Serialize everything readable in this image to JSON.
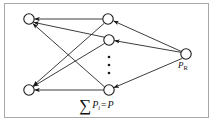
{
  "figure": {
    "type": "network-diagram",
    "width": 215,
    "height": 124,
    "background_color": "#ffffff",
    "border_color": "#a8a8a8",
    "stroke_color": "#1a1a1a"
  },
  "labels": {
    "source_node": {
      "base": "P",
      "subscript": "R",
      "full": "P_R"
    },
    "caption": {
      "sigma": "∑",
      "variable": "P",
      "subscript": "i",
      "equals": "=",
      "result": "P",
      "full": "∑ P_i = P"
    },
    "ellipsis": "⋮"
  },
  "nodes": [
    {
      "id": "L1",
      "column": "left",
      "cx": 29,
      "cy": 19,
      "r": 5.2,
      "label": ""
    },
    {
      "id": "L2",
      "column": "left",
      "cx": 29,
      "cy": 90,
      "r": 5.2,
      "label": ""
    },
    {
      "id": "M1",
      "column": "middle",
      "cx": 108,
      "cy": 19,
      "r": 5.2,
      "label": ""
    },
    {
      "id": "M2",
      "column": "middle",
      "cx": 109,
      "cy": 40,
      "r": 5.2,
      "label": ""
    },
    {
      "id": "M3",
      "column": "middle",
      "cx": 109,
      "cy": 90,
      "r": 5.2,
      "label": ""
    },
    {
      "id": "R1",
      "column": "right",
      "cx": 186,
      "cy": 54,
      "r": 5.2,
      "label": "P_R"
    }
  ],
  "ellipsis_dots": [
    {
      "cx": 109,
      "cy": 57,
      "r": 1.3
    },
    {
      "cx": 109,
      "cy": 65,
      "r": 1.3
    },
    {
      "cx": 109,
      "cy": 73,
      "r": 1.3
    }
  ],
  "edges": [
    {
      "from": "M1",
      "to": "L1",
      "direction": "left",
      "arrow": true
    },
    {
      "from": "M1",
      "to": "L2",
      "direction": "left",
      "arrow": true
    },
    {
      "from": "M2",
      "to": "L1",
      "direction": "left",
      "arrow": true
    },
    {
      "from": "M2",
      "to": "L2",
      "direction": "left",
      "arrow": true
    },
    {
      "from": "M3",
      "to": "L1",
      "direction": "left",
      "arrow": true
    },
    {
      "from": "M3",
      "to": "L2",
      "direction": "left",
      "arrow": true
    },
    {
      "from": "R1",
      "to": "M1",
      "direction": "left",
      "arrow": true
    },
    {
      "from": "R1",
      "to": "M2",
      "direction": "left",
      "arrow": true
    },
    {
      "from": "R1",
      "to": "M3",
      "direction": "left",
      "arrow": true
    }
  ]
}
